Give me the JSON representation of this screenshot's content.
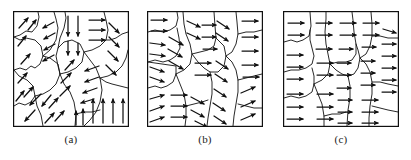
{
  "figure": {
    "kind": "orientation-field-segmentation-figure",
    "background_color": "#ffffff",
    "stroke_color": "#101010",
    "panel_count": 3,
    "panel_size_px": 116,
    "panel_top_px": 11,
    "panels": [
      {
        "id": "a",
        "caption": "(a)",
        "left_px": 13,
        "description": "Irregular regions with strongly varying arrow orientations: up-right, down-left, down, right, up.",
        "border": {
          "x": 0,
          "y": 0,
          "w": 116,
          "h": 116,
          "stroke": "#101010",
          "stroke_width": 1.2
        },
        "region_boundaries": [
          "M0,27 L8,25 L14,21 L20,22 L24,16 L26,6 L24,0",
          "M0,60 L7,58 L14,60 L18,56 L22,58 L27,54 L30,46 L28,36 L22,30 L14,28 L8,30 L0,27",
          "M0,96 L6,93 L12,95 L18,92 L22,86 L20,76 L14,70 L6,66 L0,60",
          "M30,46 L38,40 L44,30 L46,18 L44,8 L41,0",
          "M22,86 L30,84 L38,80 L44,74 L48,64 L46,54 L38,48 L30,46",
          "M22,86 L24,96 L28,104 L30,116",
          "M48,64 L56,62 L64,58 L70,52 L72,42 L68,34 L60,30 L52,32 L46,38 L44,46 L46,56 L48,64",
          "M46,38 L48,28 L52,18 L54,8 L53,0",
          "M48,64 L52,74 L58,82 L62,92 L64,104 L63,116",
          "M72,42 L80,40 L88,36 L94,30 L96,20 L94,10 L92,0",
          "M72,42 L78,50 L84,58 L88,68 L90,80 L88,92 L84,102 L78,110 L72,116",
          "M88,68 L96,66 L104,62 L110,56 L114,48 L116,40",
          "M116,78 L108,76 L100,74 L94,72 L88,68",
          "M116,22 L110,24 L104,28 L98,30 L94,30"
        ],
        "arrow_groups": [
          {
            "angle_deg": -55,
            "note": "upper-left cluster, up-right"
          },
          {
            "angle_deg": 200,
            "note": "upper-mid-left cluster, down-left"
          },
          {
            "angle_deg": 90,
            "note": "upper-mid cluster, straight down"
          },
          {
            "angle_deg": 0,
            "note": "upper-right cluster, right"
          },
          {
            "angle_deg": 35,
            "note": "far upper-right cluster, down-right"
          },
          {
            "angle_deg": -60,
            "note": "mid-left cluster, up-right"
          },
          {
            "angle_deg": 180,
            "note": "mid-right cluster, left"
          },
          {
            "angle_deg": 115,
            "note": "lower-left cluster, down-left"
          },
          {
            "angle_deg": -90,
            "note": "lower-right cluster, straight up"
          }
        ]
      },
      {
        "id": "b",
        "caption": "(b)",
        "left_px": 147,
        "description": "Regions with arrows mostly pointing right, with mild angular spread toward down-right and up-right.",
        "border": {
          "x": 0,
          "y": 0,
          "w": 116,
          "h": 116,
          "stroke": "#101010",
          "stroke_width": 1.2
        },
        "region_boundaries": [
          "M0,22 L8,20 L16,22 L24,20 L30,16 L32,8 L31,0",
          "M0,52 L8,50 L16,52 L24,50 L30,46 L34,38 L33,28 L31,18",
          "M0,78 L8,76 L14,78 L20,76 L26,72 L30,64 L30,56 L0,52",
          "M30,64 L38,60 L44,54 L46,44 L44,34 L40,24 L38,14 L37,0",
          "M30,64 L34,74 L38,84 L40,96 L40,108 L39,116",
          "M46,44 L54,42 L62,40 L68,36 L70,28 L69,16 L68,0",
          "M46,44 L52,52 L58,58 L64,62 L72,62 L78,56 L80,46 L78,36 L72,30 L70,28",
          "M64,62 L66,72 L66,84 L64,96 L62,108 L61,116",
          "M80,46 L86,42 L90,34 L92,24 L91,12 L90,0",
          "M80,46 L86,52 L90,60 L92,70 L92,82 L90,94 L88,106 L87,116",
          "M92,70 L100,68 L108,66 L116,64",
          "M92,24 L100,22 L108,22 L116,20",
          "M40,96 L48,94 L56,92 L62,90",
          "M92,94 L100,96 L108,98 L116,98"
        ],
        "arrow_groups": [
          {
            "angle_deg": 0,
            "note": "left column, right"
          },
          {
            "angle_deg": 25,
            "note": "upper-left, slightly down-right"
          },
          {
            "angle_deg": 0,
            "note": "center, right"
          },
          {
            "angle_deg": 30,
            "note": "right column, down-right"
          },
          {
            "angle_deg": -25,
            "note": "lower-left, up-right"
          },
          {
            "angle_deg": 35,
            "note": "lower-center, down-right"
          }
        ]
      },
      {
        "id": "c",
        "caption": "(c)",
        "left_px": 283,
        "description": "Nearly uniform field: all arrows point right across every region.",
        "border": {
          "x": 0,
          "y": 0,
          "w": 116,
          "h": 116,
          "stroke": "#101010",
          "stroke_width": 1.2
        },
        "region_boundaries": [
          "M0,32 L8,30 L14,32 L20,30 L26,26 L28,16 L27,0",
          "M0,62 L8,60 L16,60 L24,58 L30,54 L32,46 L30,38 L28,30 L27,20",
          "M0,88 L8,86 L16,88 L24,86 L30,82 L32,74 L32,66 L30,58",
          "M32,74 L40,70 L46,64 L48,54 L46,44 L44,34 L43,22 L44,8 L44,0",
          "M32,74 L36,84 L40,94 L42,106 L42,116",
          "M48,54 L56,52 L64,52 L70,50 L74,44 L74,34 L72,22 L71,10 L70,0",
          "M48,54 L54,60 L60,64 L66,66 L72,64 L76,58 L78,48 L76,40 L74,34",
          "M66,66 L68,76 L68,88 L66,100 L65,116",
          "M78,48 L84,44 L88,36 L90,26 L90,14 L89,0",
          "M78,48 L84,54 L88,62 L90,72 L90,84 L88,96 L87,108 L87,116",
          "M90,72 L98,72 L106,74 L116,76",
          "M90,26 L98,26 L106,28 L116,28",
          "M42,106 L50,104 L58,104 L64,102",
          "M90,96 L98,98 L106,100 L116,102"
        ],
        "arrow_groups": [
          {
            "angle_deg": 0,
            "note": "all regions, uniformly right"
          }
        ]
      }
    ]
  }
}
